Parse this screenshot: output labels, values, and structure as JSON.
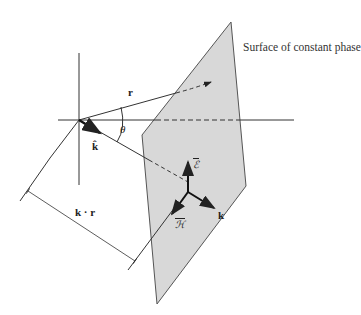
{
  "figure": {
    "caption": "Surface of constant phase",
    "labels": {
      "r": "r",
      "theta": "θ",
      "k_hat": "k̂",
      "k_dot_r": "k · r",
      "E": "ℰ",
      "H": "ℋ",
      "k": "k"
    },
    "colors": {
      "plane_fill": "#d8d8d8",
      "line": "#333333"
    }
  }
}
